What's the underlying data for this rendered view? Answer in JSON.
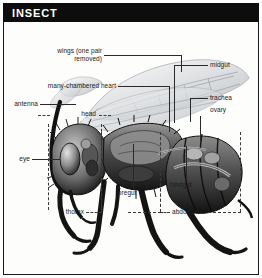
{
  "figure": {
    "title": "INSECT",
    "kind": "anatomical-cutaway-illustration",
    "style": "black-and-white engraving / halftone"
  },
  "labels": {
    "wings": "wings (one pair\nremoved)",
    "heart": "many-chambered heart",
    "antenna": "antenna",
    "head": "head",
    "eye": "eye",
    "midgut": "midgut",
    "trachea": "trachea",
    "ovary": "ovary",
    "foregut": "foregut",
    "hindgut": "hindgut",
    "thorax": "thorax",
    "abdomen": "abdomen"
  },
  "colors": {
    "titlebar_bg": "#0d0d0d",
    "title_fg": "#ffffff",
    "plate_bg": "#fdfdfb",
    "frame": "#1b1b1b",
    "label_fg": "#1a1a1a",
    "leader": "#2a2a2a",
    "wing_fill": "#d8dadd",
    "body_dark": "#1c1c1c",
    "body_mid": "#6e6e6e",
    "body_light": "#c9c9c9"
  }
}
